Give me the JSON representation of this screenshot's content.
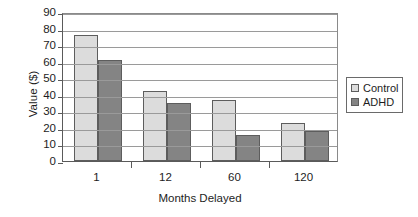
{
  "chart_data": {
    "type": "bar",
    "title": "",
    "xlabel": "Months Delayed",
    "ylabel": "Value ($)",
    "categories": [
      "1",
      "12",
      "60",
      "120"
    ],
    "series": [
      {
        "name": "Control",
        "values": [
          76,
          42,
          37,
          23
        ],
        "color": "#dcdcdc"
      },
      {
        "name": "ADHD",
        "values": [
          61,
          35,
          16,
          18
        ],
        "color": "#848484"
      }
    ],
    "ylim": [
      0,
      90
    ],
    "yticks": [
      0,
      10,
      20,
      30,
      40,
      50,
      60,
      70,
      80,
      90
    ],
    "ytick_labels": [
      "0",
      "10",
      "20",
      "30",
      "40",
      "50",
      "60",
      "70",
      "80",
      "90"
    ],
    "grid": "horizontal",
    "legend_position": "right",
    "legend_entries": [
      "Control",
      "ADHD"
    ]
  },
  "axes": {
    "y_title": "Value ($)",
    "x_title": "Months Delayed"
  },
  "legend": {
    "items": [
      {
        "label": "Control",
        "swatch": "light-gray-square"
      },
      {
        "label": "ADHD",
        "swatch": "dark-gray-square"
      }
    ]
  }
}
